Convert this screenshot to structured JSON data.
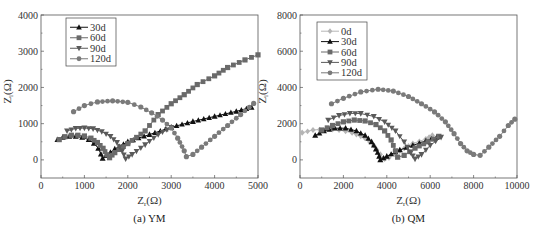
{
  "chart_data": [
    {
      "type": "scatter",
      "subtype": "nyquist-line-marker",
      "caption": "(a) YM",
      "xlabel": "Zr(Ω)",
      "ylabel": "Zi(Ω)",
      "xlim": [
        0,
        5000
      ],
      "ylim": [
        -500,
        4000
      ],
      "xticks": [
        0,
        1000,
        2000,
        3000,
        4000,
        5000
      ],
      "yticks": [
        0,
        1000,
        2000,
        3000,
        4000
      ],
      "legend_position": "upper-left",
      "series": [
        {
          "name": "30d",
          "marker": "triangle-up",
          "color": "#111111",
          "points": [
            [
              380,
              560
            ],
            [
              500,
              620
            ],
            [
              650,
              650
            ],
            [
              800,
              650
            ],
            [
              950,
              620
            ],
            [
              1100,
              560
            ],
            [
              1220,
              460
            ],
            [
              1320,
              320
            ],
            [
              1380,
              160
            ],
            [
              1420,
              40
            ],
            [
              1500,
              120
            ],
            [
              1700,
              300
            ],
            [
              2000,
              500
            ],
            [
              2500,
              700
            ],
            [
              3000,
              900
            ],
            [
              3500,
              1060
            ],
            [
              4000,
              1200
            ],
            [
              4500,
              1340
            ],
            [
              4850,
              1450
            ]
          ]
        },
        {
          "name": "60d",
          "marker": "square",
          "color": "#6a6a6a",
          "points": [
            [
              420,
              560
            ],
            [
              550,
              640
            ],
            [
              700,
              680
            ],
            [
              850,
              680
            ],
            [
              1000,
              660
            ],
            [
              1150,
              600
            ],
            [
              1300,
              480
            ],
            [
              1430,
              320
            ],
            [
              1520,
              140
            ],
            [
              1580,
              60
            ],
            [
              1700,
              200
            ],
            [
              2000,
              450
            ],
            [
              2400,
              800
            ],
            [
              2700,
              1250
            ],
            [
              3000,
              1550
            ],
            [
              3300,
              1800
            ],
            [
              3600,
              2080
            ],
            [
              4000,
              2320
            ],
            [
              4300,
              2550
            ],
            [
              4700,
              2760
            ],
            [
              5000,
              2900
            ]
          ]
        },
        {
          "name": "90d",
          "marker": "triangle-down",
          "color": "#5a5a5a",
          "points": [
            [
              600,
              800
            ],
            [
              800,
              870
            ],
            [
              1000,
              880
            ],
            [
              1200,
              860
            ],
            [
              1400,
              780
            ],
            [
              1600,
              650
            ],
            [
              1750,
              480
            ],
            [
              1870,
              250
            ],
            [
              1950,
              30
            ],
            [
              2100,
              150
            ],
            [
              2400,
              420
            ],
            [
              2700,
              700
            ],
            [
              3000,
              900
            ]
          ]
        },
        {
          "name": "120d",
          "marker": "circle",
          "color": "#7a7a7a",
          "points": [
            [
              750,
              1330
            ],
            [
              1000,
              1500
            ],
            [
              1300,
              1600
            ],
            [
              1650,
              1630
            ],
            [
              2000,
              1590
            ],
            [
              2300,
              1460
            ],
            [
              2550,
              1300
            ],
            [
              2800,
              1100
            ],
            [
              3000,
              880
            ],
            [
              3150,
              600
            ],
            [
              3300,
              250
            ],
            [
              3350,
              90
            ],
            [
              3500,
              150
            ],
            [
              3700,
              350
            ],
            [
              4000,
              650
            ],
            [
              4300,
              950
            ],
            [
              4600,
              1250
            ],
            [
              4900,
              1560
            ]
          ]
        }
      ]
    },
    {
      "type": "scatter",
      "subtype": "nyquist-line-marker",
      "caption": "(b) QM",
      "xlabel": "Zr(Ω)",
      "ylabel": "Zi(Ω)",
      "xlim": [
        0,
        10000
      ],
      "ylim": [
        -1000,
        8000
      ],
      "xticks": [
        0,
        2000,
        4000,
        6000,
        8000,
        10000
      ],
      "yticks": [
        0,
        2000,
        4000,
        6000,
        8000
      ],
      "legend_position": "upper-left",
      "series": [
        {
          "name": "0d",
          "marker": "diamond",
          "color": "#b5b5b5",
          "points": [
            [
              100,
              1500
            ],
            [
              600,
              1650
            ],
            [
              1200,
              1700
            ],
            [
              1800,
              1650
            ],
            [
              2400,
              1500
            ],
            [
              3000,
              1200
            ],
            [
              3400,
              800
            ],
            [
              3700,
              300
            ],
            [
              3900,
              50
            ],
            [
              4100,
              120
            ],
            [
              4600,
              500
            ],
            [
              5200,
              900
            ],
            [
              5800,
              1150
            ],
            [
              6100,
              1350
            ]
          ]
        },
        {
          "name": "30d",
          "marker": "triangle-up",
          "color": "#111111",
          "points": [
            [
              700,
              1350
            ],
            [
              1100,
              1600
            ],
            [
              1600,
              1750
            ],
            [
              2100,
              1750
            ],
            [
              2600,
              1600
            ],
            [
              3000,
              1350
            ],
            [
              3300,
              1000
            ],
            [
              3500,
              600
            ],
            [
              3650,
              200
            ],
            [
              3700,
              0
            ],
            [
              4000,
              200
            ],
            [
              4600,
              550
            ],
            [
              5200,
              800
            ],
            [
              5800,
              1050
            ],
            [
              6300,
              1250
            ]
          ]
        },
        {
          "name": "60d",
          "marker": "square",
          "color": "#6a6a6a",
          "points": [
            [
              1000,
              1650
            ],
            [
              1500,
              1900
            ],
            [
              2000,
              2100
            ],
            [
              2500,
              2200
            ],
            [
              3000,
              2150
            ],
            [
              3500,
              1950
            ],
            [
              3900,
              1600
            ],
            [
              4200,
              1100
            ],
            [
              4400,
              500
            ],
            [
              4500,
              150
            ],
            [
              4800,
              250
            ],
            [
              5300,
              650
            ],
            [
              5900,
              1000
            ],
            [
              6400,
              1300
            ]
          ]
        },
        {
          "name": "90d",
          "marker": "triangle-down",
          "color": "#5a5a5a",
          "points": [
            [
              1300,
              2200
            ],
            [
              1800,
              2450
            ],
            [
              2300,
              2570
            ],
            [
              2800,
              2560
            ],
            [
              3400,
              2400
            ],
            [
              3900,
              2100
            ],
            [
              4400,
              1600
            ],
            [
              4800,
              1000
            ],
            [
              5100,
              400
            ],
            [
              5300,
              50
            ],
            [
              5600,
              300
            ],
            [
              6000,
              800
            ],
            [
              6500,
              1250
            ]
          ]
        },
        {
          "name": "120d",
          "marker": "circle",
          "color": "#7a7a7a",
          "points": [
            [
              1450,
              3100
            ],
            [
              2000,
              3400
            ],
            [
              2800,
              3750
            ],
            [
              3600,
              3900
            ],
            [
              4300,
              3800
            ],
            [
              5000,
              3500
            ],
            [
              5600,
              3100
            ],
            [
              6200,
              2650
            ],
            [
              6700,
              2100
            ],
            [
              7100,
              1450
            ],
            [
              7400,
              900
            ],
            [
              7700,
              500
            ],
            [
              8000,
              300
            ],
            [
              8300,
              250
            ],
            [
              8700,
              700
            ],
            [
              9200,
              1300
            ],
            [
              9600,
              1900
            ],
            [
              9900,
              2250
            ]
          ]
        }
      ]
    }
  ]
}
